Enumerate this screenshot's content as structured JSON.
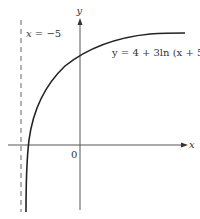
{
  "diagram": {
    "type": "function-graph",
    "axes": {
      "x_label": "x",
      "y_label": "y",
      "origin_label": "0"
    },
    "asymptote": {
      "label_var": "x",
      "label_rest": " = −5",
      "style": "dashed"
    },
    "curve": {
      "equation_label": "y = 4 + 3ln (x + 5)"
    },
    "colors": {
      "axis": "#555555",
      "curve": "#222222",
      "asymptote": "#666666",
      "text": "#333333"
    }
  }
}
